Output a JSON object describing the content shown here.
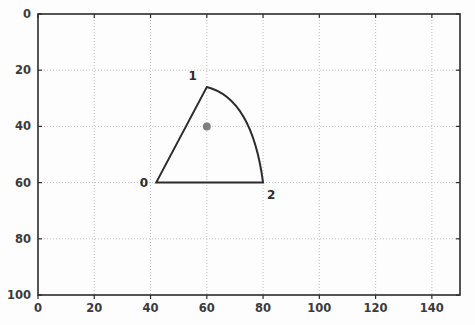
{
  "chart_data": {
    "type": "line",
    "title": "",
    "xlabel": "",
    "ylabel": "",
    "xlim": [
      0,
      150
    ],
    "ylim": [
      0,
      100
    ],
    "y_axis_inverted": true,
    "grid": true,
    "grid_style": "dotted",
    "legend": "none",
    "x_ticks": [
      0,
      20,
      40,
      60,
      80,
      100,
      120,
      140
    ],
    "y_ticks": [
      0,
      20,
      40,
      60,
      80,
      100
    ],
    "x_tick_labels": [
      "0",
      "20",
      "40",
      "60",
      "80",
      "100",
      "120",
      "140"
    ],
    "y_tick_labels": [
      "0",
      "20",
      "40",
      "60",
      "80",
      "100"
    ],
    "annotations": [
      {
        "text": "0",
        "x": 42,
        "y": 60,
        "anchor": "left"
      },
      {
        "text": "1",
        "x": 60,
        "y": 26,
        "anchor": "above-left"
      },
      {
        "text": "2",
        "x": 80,
        "y": 60,
        "anchor": "below-right"
      }
    ],
    "series": [
      {
        "name": "wedge-outline",
        "kind": "closed-path",
        "vertices": [
          {
            "label": "0",
            "x": 42,
            "y": 60
          },
          {
            "label": "1",
            "x": 60,
            "y": 26
          },
          {
            "label": "2",
            "x": 80,
            "y": 60
          }
        ],
        "segments": [
          {
            "from": "0",
            "to": "1",
            "kind": "straight"
          },
          {
            "from": "1",
            "to": "2",
            "kind": "curve",
            "control": {
              "x": 76,
              "y": 30
            }
          },
          {
            "from": "2",
            "to": "0",
            "kind": "straight"
          }
        ],
        "color": "#2b2b2b",
        "line_width": 2
      },
      {
        "name": "centroid-marker",
        "kind": "scatter",
        "points": [
          {
            "x": 60,
            "y": 40
          }
        ],
        "color": "#808080",
        "marker": "circle",
        "marker_size": 5
      }
    ]
  },
  "colors": {
    "background": "#fdfdfd",
    "axis": "#2b2b2b",
    "grid": "#bdbdbd",
    "outline": "#2b2b2b",
    "marker": "#808080",
    "tick_text": "#3a3a3a"
  }
}
